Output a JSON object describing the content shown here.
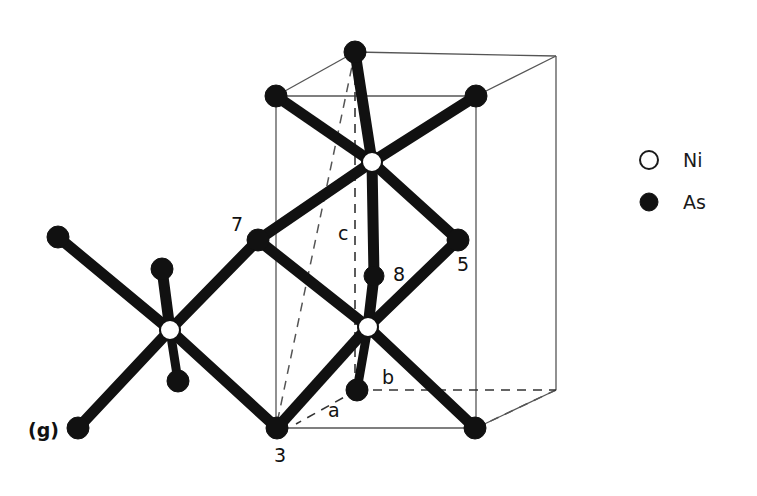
{
  "figure": {
    "panel_label": "(g)",
    "width": 757,
    "height": 496,
    "background": "#ffffff",
    "ink_color": "#111111",
    "cell_line_color": "#555555"
  },
  "legend": {
    "items": [
      {
        "symbol": "open-circle",
        "label": "Ni",
        "fill": "#ffffff",
        "stroke": "#1a1a1a",
        "cx": 649,
        "cy": 160,
        "r": 9
      },
      {
        "symbol": "filled-circle",
        "label": "As",
        "fill": "#111111",
        "stroke": "#111111",
        "cx": 649,
        "cy": 202,
        "r": 9
      }
    ],
    "label_x": 683
  },
  "axis_labels": [
    {
      "name": "c",
      "text": "c",
      "x": 338,
      "y": 240
    },
    {
      "name": "b",
      "text": "b",
      "x": 382,
      "y": 384
    },
    {
      "name": "a",
      "text": "a",
      "x": 328,
      "y": 417
    }
  ],
  "atom_labels": [
    {
      "name": "label-7",
      "text": "7",
      "x": 231,
      "y": 231
    },
    {
      "name": "label-5",
      "text": "5",
      "x": 457,
      "y": 271
    },
    {
      "name": "label-8",
      "text": "8",
      "x": 393,
      "y": 281
    },
    {
      "name": "label-3",
      "text": "3",
      "x": 274,
      "y": 462
    }
  ],
  "structure": {
    "ni_atoms": [
      {
        "id": "ni-top",
        "cx": 372,
        "cy": 162,
        "r": 10
      },
      {
        "id": "ni-bottom",
        "cx": 368,
        "cy": 327,
        "r": 10
      },
      {
        "id": "ni-left",
        "cx": 170,
        "cy": 330,
        "r": 10
      }
    ],
    "as_atoms": [
      {
        "id": "as-top-back",
        "cx": 355,
        "cy": 52,
        "r": 11,
        "label": ""
      },
      {
        "id": "as-top-left",
        "cx": 276,
        "cy": 96,
        "r": 11,
        "label": ""
      },
      {
        "id": "as-top-right",
        "cx": 476,
        "cy": 96,
        "r": 11,
        "label": ""
      },
      {
        "id": "as-7",
        "cx": 258,
        "cy": 240,
        "r": 11,
        "label": "7"
      },
      {
        "id": "as-5",
        "cx": 458,
        "cy": 240,
        "r": 11,
        "label": "5"
      },
      {
        "id": "as-8",
        "cx": 374,
        "cy": 276,
        "r": 10,
        "label": "8"
      },
      {
        "id": "as-b-front",
        "cx": 357,
        "cy": 390,
        "r": 11,
        "label": ""
      },
      {
        "id": "as-3",
        "cx": 277,
        "cy": 428,
        "r": 11,
        "label": "3"
      },
      {
        "id": "as-bottom-right",
        "cx": 475,
        "cy": 428,
        "r": 11,
        "label": ""
      },
      {
        "id": "as-left-upper",
        "cx": 58,
        "cy": 237,
        "r": 11,
        "label": ""
      },
      {
        "id": "as-left-stub",
        "cx": 162,
        "cy": 269,
        "r": 11,
        "label": ""
      },
      {
        "id": "as-left-lower",
        "cx": 178,
        "cy": 381,
        "r": 11,
        "label": ""
      },
      {
        "id": "as-left-bottom",
        "cx": 78,
        "cy": 428,
        "r": 11,
        "label": ""
      }
    ],
    "bonds": [
      {
        "from": "ni-top",
        "to": "as-top-back",
        "w": 11
      },
      {
        "from": "ni-top",
        "to": "as-top-left",
        "w": 11
      },
      {
        "from": "ni-top",
        "to": "as-top-right",
        "w": 11
      },
      {
        "from": "ni-top",
        "to": "as-7",
        "w": 11
      },
      {
        "from": "ni-top",
        "to": "as-5",
        "w": 11
      },
      {
        "from": "ni-top",
        "to": "as-8",
        "w": 11
      },
      {
        "from": "ni-bottom",
        "to": "as-8",
        "w": 11
      },
      {
        "from": "ni-bottom",
        "to": "as-7",
        "w": 11
      },
      {
        "from": "ni-bottom",
        "to": "as-5",
        "w": 11
      },
      {
        "from": "ni-bottom",
        "to": "as-3",
        "w": 11
      },
      {
        "from": "ni-bottom",
        "to": "as-bottom-right",
        "w": 11
      },
      {
        "from": "ni-bottom",
        "to": "as-b-front",
        "w": 9
      },
      {
        "from": "ni-left",
        "to": "as-left-upper",
        "w": 11
      },
      {
        "from": "ni-left",
        "to": "as-left-stub",
        "w": 11
      },
      {
        "from": "ni-left",
        "to": "as-7",
        "w": 11
      },
      {
        "from": "ni-left",
        "to": "as-left-lower",
        "w": 9
      },
      {
        "from": "ni-left",
        "to": "as-left-bottom",
        "w": 11
      },
      {
        "from": "ni-left",
        "to": "as-3",
        "w": 11
      }
    ],
    "cell": {
      "front_top_left": {
        "x": 276,
        "y": 96
      },
      "front_top_right": {
        "x": 476,
        "y": 96
      },
      "front_bot_left": {
        "x": 276,
        "y": 428
      },
      "front_bot_right": {
        "x": 476,
        "y": 428
      },
      "back_top_left": {
        "x": 355,
        "y": 52
      },
      "back_top_right": {
        "x": 556,
        "y": 56
      },
      "back_bot_right": {
        "x": 556,
        "y": 390
      },
      "solid_edges": [
        [
          "front_top_left",
          "front_top_right"
        ],
        [
          "front_top_left",
          "front_bot_left"
        ],
        [
          "front_top_right",
          "front_bot_right"
        ],
        [
          "front_bot_left",
          "front_bot_right"
        ],
        [
          "back_top_left",
          "front_top_left"
        ],
        [
          "back_top_left",
          "back_top_right"
        ],
        [
          "back_top_right",
          "front_top_right"
        ],
        [
          "back_top_right",
          "back_bot_right"
        ],
        [
          "back_bot_right",
          "front_bot_right"
        ]
      ],
      "dashed_edges": [
        [
          "back_top_left",
          "front_bot_left"
        ],
        [
          "front_bot_right",
          "back_bot_right"
        ]
      ]
    },
    "axis_vectors": {
      "c_axis": {
        "x1": 355,
        "y1": 60,
        "x2": 355,
        "y2": 390,
        "style": "dashed"
      },
      "b_axis": {
        "x1": 357,
        "y1": 390,
        "x2": 556,
        "y2": 390,
        "style": "dashed"
      },
      "a_axis": {
        "x1": 357,
        "y1": 390,
        "x2": 296,
        "y2": 424,
        "style": "dashed"
      }
    }
  }
}
